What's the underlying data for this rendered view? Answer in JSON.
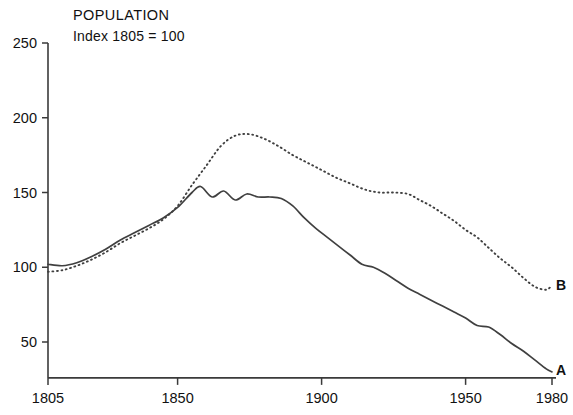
{
  "chart_data": {
    "type": "line",
    "title": "POPULATION",
    "subtitle": "Index  1805 = 100",
    "xlabel": "",
    "ylabel": "",
    "xlim": [
      1805,
      1980
    ],
    "ylim": [
      26,
      250
    ],
    "grid": false,
    "legend_position": "inline-right-end",
    "xticks": [
      1805,
      1850,
      1900,
      1950,
      1980
    ],
    "xticklabels": [
      "1805",
      "1850",
      "1900",
      "1950",
      "1980"
    ],
    "yticks": [
      50,
      100,
      150,
      200,
      250
    ],
    "yticklabels": [
      "50",
      "100",
      "150",
      "200",
      "250"
    ],
    "series": [
      {
        "name": "A",
        "label": "A",
        "style": "solid",
        "x": [
          1805,
          1810,
          1815,
          1820,
          1825,
          1830,
          1835,
          1840,
          1845,
          1850,
          1855,
          1858,
          1862,
          1866,
          1870,
          1874,
          1878,
          1882,
          1886,
          1890,
          1894,
          1898,
          1902,
          1906,
          1910,
          1914,
          1918,
          1922,
          1926,
          1930,
          1934,
          1938,
          1942,
          1946,
          1950,
          1954,
          1958,
          1962,
          1966,
          1970,
          1974,
          1978,
          1980
        ],
        "values": [
          102,
          101,
          103,
          107,
          112,
          118,
          123,
          128,
          133,
          140,
          150,
          154,
          147,
          151,
          145,
          149,
          147,
          147,
          146,
          141,
          133,
          126,
          120,
          114,
          108,
          102,
          100,
          96,
          91,
          86,
          82,
          78,
          74,
          70,
          66,
          61,
          60,
          55,
          49,
          44,
          38,
          32,
          30
        ]
      },
      {
        "name": "B",
        "label": "B",
        "style": "dotted",
        "x": [
          1805,
          1810,
          1815,
          1820,
          1825,
          1830,
          1835,
          1840,
          1845,
          1850,
          1855,
          1860,
          1865,
          1870,
          1875,
          1880,
          1885,
          1890,
          1895,
          1900,
          1905,
          1910,
          1915,
          1920,
          1925,
          1930,
          1934,
          1938,
          1942,
          1946,
          1950,
          1954,
          1958,
          1962,
          1966,
          1970,
          1974,
          1978,
          1980
        ],
        "values": [
          97,
          98,
          101,
          105,
          110,
          116,
          121,
          126,
          132,
          141,
          155,
          168,
          181,
          188,
          189,
          186,
          181,
          175,
          170,
          165,
          160,
          156,
          152,
          150,
          150,
          149,
          145,
          141,
          136,
          131,
          125,
          120,
          113,
          106,
          100,
          93,
          87,
          85,
          88
        ]
      }
    ],
    "annotations": [
      {
        "text": "A",
        "x": 1982,
        "y": 31
      },
      {
        "text": "B",
        "x": 1982,
        "y": 88
      }
    ]
  },
  "axis_color": "#3a3a3a",
  "line_color": "#404040",
  "text_color": "#111111",
  "background": "#ffffff"
}
